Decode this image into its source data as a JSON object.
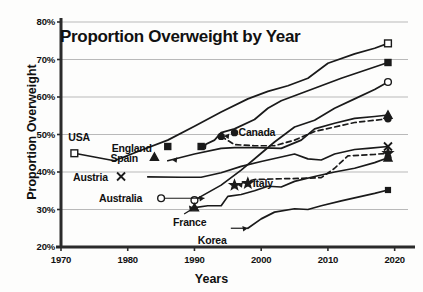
{
  "chart_data": {
    "type": "line",
    "title": "Proportion Overweight by Year",
    "xlabel": "Years",
    "ylabel": "Proportion Overweight",
    "xlim": [
      1970,
      2022
    ],
    "ylim": [
      20,
      80
    ],
    "xticks": [
      "1970",
      "1980",
      "1990",
      "2000",
      "2010",
      "2020"
    ],
    "xtick_values": [
      1970,
      1980,
      1990,
      2000,
      2010,
      2020
    ],
    "yticks": [
      "20%",
      "30%",
      "40%",
      "50%",
      "60%",
      "70%",
      "80%"
    ],
    "ytick_values": [
      20,
      30,
      40,
      50,
      60,
      70,
      80
    ],
    "grid": "horizontal",
    "legend": "inline-labels",
    "series": [
      {
        "name": "USA",
        "marker": "open-square",
        "dash": false,
        "label_x": 1972,
        "label_y": 47.5,
        "end_value": 74.3,
        "points": [
          [
            1972,
            45.0
          ],
          [
            1975,
            44.0
          ],
          [
            1978,
            43.0
          ],
          [
            1982,
            45.8
          ],
          [
            1986,
            48.5
          ],
          [
            1990,
            52.2
          ],
          [
            1994,
            56.0
          ],
          [
            1998,
            59.5
          ],
          [
            2001,
            61.5
          ],
          [
            2004,
            63.0
          ],
          [
            2007,
            65.0
          ],
          [
            2010,
            69.0
          ],
          [
            2014,
            71.5
          ],
          [
            2017,
            73.0
          ],
          [
            2019,
            74.3
          ]
        ]
      },
      {
        "name": "England",
        "marker": "filled-square",
        "dash": false,
        "label_x": 1986,
        "label_y": 46.8,
        "end_value": 69.2,
        "points": [
          [
            1991,
            46.8
          ],
          [
            1993,
            48.5
          ],
          [
            1994,
            50.5
          ],
          [
            1996,
            51.5
          ],
          [
            1999,
            54.0
          ],
          [
            2001,
            57.0
          ],
          [
            2003,
            59.0
          ],
          [
            2006,
            61.0
          ],
          [
            2009,
            63.0
          ],
          [
            2012,
            65.0
          ],
          [
            2015,
            66.8
          ],
          [
            2019,
            69.2
          ]
        ]
      },
      {
        "name": "Australia",
        "marker": "open-circle",
        "dash": false,
        "label_x": 1985,
        "label_y": 33.0,
        "end_value": 64.0,
        "points": [
          [
            1990,
            32.5
          ],
          [
            1994,
            36.5
          ],
          [
            1997,
            40.5
          ],
          [
            2000,
            45.0
          ],
          [
            2002,
            48.0
          ],
          [
            2005,
            52.0
          ],
          [
            2008,
            53.8
          ],
          [
            2011,
            57.0
          ],
          [
            2014,
            59.5
          ],
          [
            2017,
            62.0
          ],
          [
            2019,
            64.0
          ]
        ]
      },
      {
        "name": "Spain",
        "marker": "triangle",
        "dash": false,
        "label_x": 1984,
        "label_y": 44.0,
        "end_value": 55.2,
        "points": [
          [
            1986,
            43.0
          ],
          [
            1990,
            44.8
          ],
          [
            1994,
            46.3
          ],
          [
            1996,
            46.5
          ],
          [
            1999,
            46.5
          ],
          [
            2003,
            46.3
          ],
          [
            2006,
            48.5
          ],
          [
            2008,
            51.5
          ],
          [
            2011,
            53.0
          ],
          [
            2014,
            54.3
          ],
          [
            2017,
            54.8
          ],
          [
            2019,
            55.2
          ]
        ]
      },
      {
        "name": "Canada",
        "marker": "filled-circle",
        "dash": true,
        "label_x": 1996,
        "label_y": 50.5,
        "end_value": 54.2,
        "points": [
          [
            1994,
            49.5
          ],
          [
            1996,
            47.3
          ],
          [
            1999,
            47.0
          ],
          [
            2002,
            47.0
          ],
          [
            2005,
            48.5
          ],
          [
            2008,
            50.8
          ],
          [
            2011,
            52.0
          ],
          [
            2014,
            53.2
          ],
          [
            2017,
            53.8
          ],
          [
            2019,
            54.2
          ]
        ]
      },
      {
        "name": "Austria",
        "marker": "x-cross",
        "dash": false,
        "label_x": 1979,
        "label_y": 38.8,
        "end_value": 46.8,
        "points": [
          [
            1983,
            38.7
          ],
          [
            1988,
            38.6
          ],
          [
            1991,
            38.6
          ],
          [
            1994,
            39.8
          ],
          [
            1997,
            41.5
          ],
          [
            2000,
            42.8
          ],
          [
            2003,
            44.0
          ],
          [
            2005,
            44.8
          ],
          [
            2007,
            43.5
          ],
          [
            2009,
            43.2
          ],
          [
            2011,
            44.8
          ],
          [
            2014,
            46.0
          ],
          [
            2016,
            46.3
          ],
          [
            2019,
            46.8
          ]
        ]
      },
      {
        "name": "Italy",
        "marker": "star",
        "dash": true,
        "label_x": 1998,
        "label_y": 37.0,
        "end_value": 45.0,
        "points": [
          [
            1996,
            36.5
          ],
          [
            1999,
            38.0
          ],
          [
            2003,
            38.2
          ],
          [
            2006,
            38.3
          ],
          [
            2009,
            38.5
          ],
          [
            2011,
            41.0
          ],
          [
            2013,
            44.3
          ],
          [
            2015,
            44.5
          ],
          [
            2017,
            44.7
          ],
          [
            2019,
            45.0
          ]
        ]
      },
      {
        "name": "France",
        "marker": "filled-triangle",
        "dash": false,
        "label_x": 1988,
        "label_y": 28.8,
        "end_value": 43.8,
        "points": [
          [
            1990,
            30.5
          ],
          [
            1992,
            31.0
          ],
          [
            1994,
            31.0
          ],
          [
            1995,
            33.5
          ],
          [
            1997,
            34.0
          ],
          [
            1999,
            35.0
          ],
          [
            2001,
            36.2
          ],
          [
            2003,
            36.0
          ],
          [
            2005,
            37.5
          ],
          [
            2008,
            38.8
          ],
          [
            2011,
            40.0
          ],
          [
            2014,
            41.0
          ],
          [
            2017,
            42.5
          ],
          [
            2019,
            43.8
          ]
        ]
      },
      {
        "name": "Korea",
        "marker": "filled-square-small",
        "dash": false,
        "label_x": 1995,
        "label_y": 25.0,
        "end_value": 35.2,
        "points": [
          [
            1998,
            25.0
          ],
          [
            2000,
            27.5
          ],
          [
            2002,
            29.3
          ],
          [
            2005,
            30.2
          ],
          [
            2007,
            30.0
          ],
          [
            2009,
            31.0
          ],
          [
            2012,
            32.3
          ],
          [
            2015,
            33.5
          ],
          [
            2017,
            34.3
          ],
          [
            2019,
            35.2
          ]
        ]
      }
    ]
  },
  "label_anchors": {
    "usa": "USA",
    "england": "England",
    "spain": "Spain",
    "austria": "Austria",
    "australia": "Australia",
    "france": "France",
    "canada": "Canada",
    "italy": "Italy",
    "korea": "Korea"
  }
}
